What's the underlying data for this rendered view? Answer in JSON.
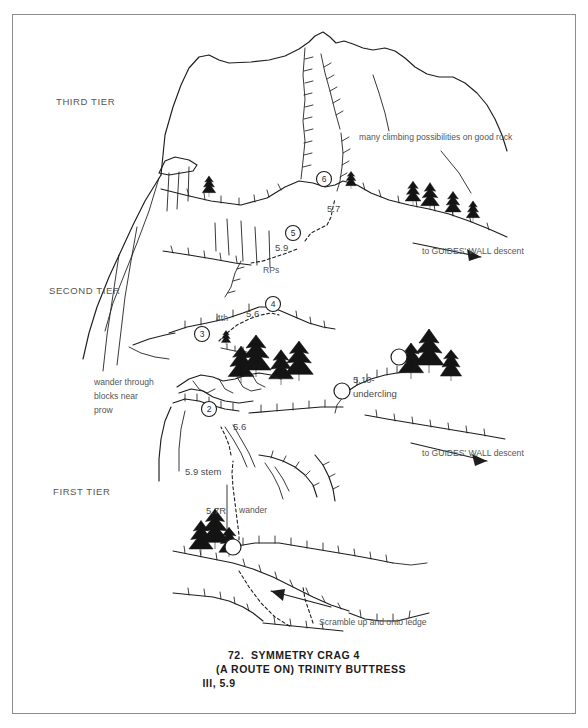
{
  "document": {
    "type": "climbing-route-topo",
    "caption": {
      "number": "72.",
      "line1": "72.  SYMMETRY CRAG 4",
      "line2": "(A ROUTE ON) TRINITY BUTTRESS",
      "line3": "III, 5.9",
      "crag_name": "SYMMETRY CRAG 4",
      "formation": "(A ROUTE ON) TRINITY BUTTRESS",
      "grade": "III, 5.9"
    }
  },
  "topo": {
    "tier_labels": [
      {
        "text": "THIRD TIER",
        "x": 55,
        "y": 104
      },
      {
        "text": "SECOND TIER",
        "x": 48,
        "y": 293
      },
      {
        "text": "FIRST TIER",
        "x": 52,
        "y": 494
      }
    ],
    "notes": [
      {
        "text": "many climbing possibilities on good rock",
        "x": 358,
        "y": 139
      },
      {
        "text": "to GUIDES' WALL descent",
        "x": 421,
        "y": 253
      },
      {
        "text": "to GUIDES' WALL descent",
        "x": 421,
        "y": 455
      },
      {
        "text": "wander through",
        "x": 93,
        "y": 384
      },
      {
        "text": "blocks near",
        "x": 93,
        "y": 398
      },
      {
        "text": "prow",
        "x": 93,
        "y": 412
      },
      {
        "text": "Scramble up and onto ledge",
        "x": 318,
        "y": 624
      },
      {
        "text": "RPs",
        "x": 262,
        "y": 272
      },
      {
        "text": "4th",
        "x": 215,
        "y": 320
      },
      {
        "text": "wander",
        "x": 238,
        "y": 512
      }
    ],
    "grades": [
      {
        "text": "5.7",
        "x": 326,
        "y": 211
      },
      {
        "text": "5.9",
        "x": 274,
        "y": 250
      },
      {
        "text": "5.6",
        "x": 245,
        "y": 316
      },
      {
        "text": "5.10-",
        "x": 352,
        "y": 382
      },
      {
        "text": "undercling",
        "x": 352,
        "y": 396
      },
      {
        "text": "5.6",
        "x": 232,
        "y": 429
      },
      {
        "text": "5.9 stem",
        "x": 184,
        "y": 474
      },
      {
        "text": "5.7R",
        "x": 205,
        "y": 513
      }
    ],
    "belay_stations": [
      {
        "pitch": "6",
        "x": 323,
        "y": 178,
        "r": 7.5
      },
      {
        "pitch": "5",
        "x": 292,
        "y": 232,
        "r": 7.5
      },
      {
        "pitch": "4",
        "x": 272,
        "y": 303,
        "r": 7.5
      },
      {
        "pitch": "3",
        "x": 201,
        "y": 333,
        "r": 7.5
      },
      {
        "pitch": "2",
        "x": 208,
        "y": 408,
        "r": 7.5
      }
    ],
    "plain_circles": [
      {
        "x": 398,
        "y": 356,
        "r": 8
      },
      {
        "x": 341,
        "y": 390,
        "r": 8
      },
      {
        "x": 232,
        "y": 546,
        "r": 8
      }
    ]
  },
  "colors": {
    "ink": "#1d1d1d",
    "label_gray": "#555555",
    "frame": "#8d8d8d",
    "paper": "#ffffff"
  }
}
